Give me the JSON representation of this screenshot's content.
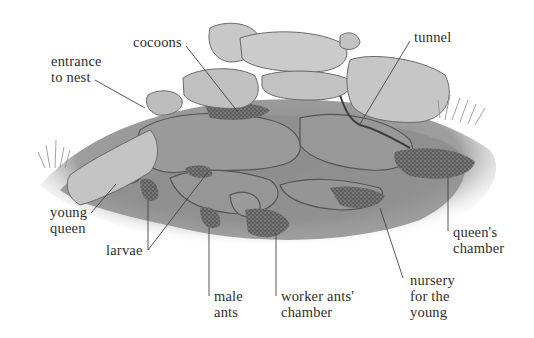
{
  "diagram": {
    "labels": [
      {
        "id": "entrance",
        "text": "entrance\nto nest"
      },
      {
        "id": "cocoons",
        "text": "cocoons"
      },
      {
        "id": "tunnel",
        "text": "tunnel"
      },
      {
        "id": "young-queen",
        "text": "young\nqueen"
      },
      {
        "id": "larvae",
        "text": "larvae"
      },
      {
        "id": "male-ants",
        "text": "male\nants"
      },
      {
        "id": "worker-chamber",
        "text": "worker ants'\nchamber"
      },
      {
        "id": "nursery",
        "text": "nursery\nfor the\nyoung"
      },
      {
        "id": "queens-chamber",
        "text": "queen's\nchamber"
      }
    ],
    "colors": {
      "stone_light": "#c9c9c9",
      "stone_mid": "#a6a6a6",
      "earth": "#8f8f8f",
      "chamber": "#6a6a6a",
      "leader_line": "#444444",
      "text": "#2e2e2e"
    }
  }
}
